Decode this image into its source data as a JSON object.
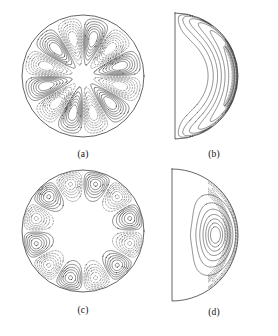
{
  "figure": {
    "title_fragment_top": "",
    "background_color": "#ffffff",
    "line_color": "#2b2b2b",
    "dashed_line_color": "#4a4a4a",
    "boundary_color": "#222222",
    "panel_count": 4
  },
  "panels": [
    {
      "id": "a",
      "label": "(a)",
      "shape": "circle",
      "description": "equatorial plane, full disk",
      "symmetry_fold": 6,
      "center": {
        "x": 83,
        "y": 76
      },
      "radius": 61,
      "solid_cells": 6,
      "dashed_cells": 6,
      "core_empty_radius": 18
    },
    {
      "id": "b",
      "label": "(b)",
      "shape": "half-disk",
      "description": "meridional section, half disk",
      "axis_x": 175,
      "top_y": 16,
      "bottom_y": 143,
      "radius": 63,
      "solid_contours": 8,
      "dashed_contours": 9
    },
    {
      "id": "c",
      "label": "(c)",
      "shape": "circle",
      "description": "equatorial plane, full disk",
      "symmetry_fold": 6,
      "center": {
        "x": 83,
        "y": 231
      },
      "radius": 61,
      "solid_cells": 6,
      "dashed_cells": 6,
      "core_empty_radius": 30
    },
    {
      "id": "d",
      "label": "(d)",
      "shape": "half-disk",
      "description": "meridional section, half disk with vortex core",
      "axis_x": 172,
      "top_y": 172,
      "bottom_y": 300,
      "radius": 66,
      "solid_loops": 7,
      "dashed_contours": 6,
      "vortex_center": {
        "x": 237,
        "y": 237
      }
    }
  ],
  "chart_data": {
    "type": "line",
    "title": "",
    "xlabel": "",
    "ylabel": "",
    "plot_kind": "contour",
    "panels": [
      {
        "label": "(a)",
        "geometry": "full-disk equatorial section",
        "azimuthal_wavenumber": 6,
        "contour_levels_solid": [
          0.2,
          0.4,
          0.6,
          0.8,
          1.0
        ],
        "contour_levels_dashed": [
          -1.0,
          -0.8,
          -0.6,
          -0.4,
          -0.2
        ],
        "extrema_radius_fraction": 0.62,
        "legend": [
          "solid = positive",
          "dashed = negative"
        ]
      },
      {
        "label": "(b)",
        "geometry": "meridional half-disk",
        "contour_levels_solid": [
          0.125,
          0.25,
          0.375,
          0.5,
          0.625,
          0.75,
          0.875,
          1.0
        ],
        "contour_levels_dashed": [
          -0.1,
          -0.2,
          -0.3,
          -0.4,
          -0.5,
          -0.6,
          -0.7,
          -0.8,
          -0.9
        ],
        "max_location_fraction_of_radius": 0.92,
        "legend": [
          "solid = positive",
          "dashed = negative"
        ]
      },
      {
        "label": "(c)",
        "geometry": "full-disk equatorial section",
        "azimuthal_wavenumber": 6,
        "contour_levels_solid": [
          0.2,
          0.4,
          0.6,
          0.8,
          1.0
        ],
        "contour_levels_dashed": [
          -1.0,
          -0.8,
          -0.6,
          -0.4,
          -0.2
        ],
        "extrema_radius_fraction": 0.82,
        "legend": [
          "solid = positive",
          "dashed = negative"
        ]
      },
      {
        "label": "(d)",
        "geometry": "meridional half-disk",
        "contour_levels_solid": [
          0.15,
          0.3,
          0.45,
          0.6,
          0.75,
          0.9,
          1.0
        ],
        "contour_levels_dashed": [
          -0.15,
          -0.3,
          -0.45,
          -0.6,
          -0.75,
          -0.9
        ],
        "vortex_center_radius_fraction": 0.62,
        "legend": [
          "solid = positive",
          "dashed = negative"
        ]
      }
    ]
  }
}
